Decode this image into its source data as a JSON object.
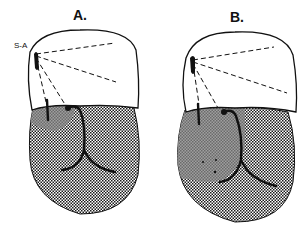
{
  "figure": {
    "panels": [
      {
        "id": "A",
        "label": "A.",
        "node_label": "S-A",
        "shaded_region": "small"
      },
      {
        "id": "B",
        "label": "B.",
        "node_label": "",
        "shaded_region": "large"
      }
    ],
    "colors": {
      "outline": "#111111",
      "atrium_fill": "#ffffff",
      "ventricle_dot": "#222222",
      "shade": "#8a8a8a"
    }
  }
}
